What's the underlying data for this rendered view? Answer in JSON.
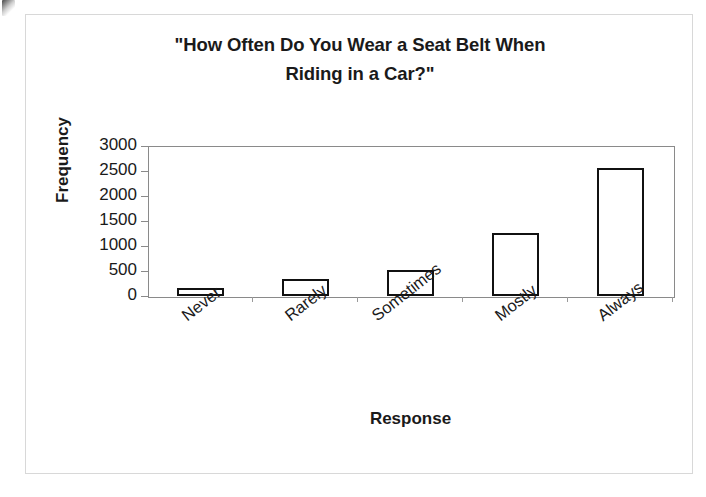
{
  "chart_data": {
    "type": "bar",
    "title": "\"How Often Do You Wear a Seat Belt When Riding in a Car?\"",
    "title_line1": "\"How Often Do You Wear a Seat Belt When",
    "title_line2": "Riding in a Car?\"",
    "xlabel": "Response",
    "ylabel": "Frequency",
    "categories": [
      "Never",
      "Rarely",
      "Sometimes",
      "Mostly",
      "Always"
    ],
    "values": [
      160,
      340,
      520,
      1270,
      2560
    ],
    "ylim": [
      0,
      3000
    ],
    "ytick_values": [
      3000,
      2500,
      2000,
      1500,
      1000,
      500,
      0
    ],
    "ytick_labels": [
      "3000",
      "2500",
      "2000",
      "1500",
      "1000",
      "500",
      "0"
    ],
    "grid": false,
    "legend": false,
    "bar_fill_color": "#ffffff",
    "bar_edge_color": "#111111",
    "axis_color": "#8a8a8a",
    "text_color": "#1a1a1a",
    "xtick_label_rotation": -38
  }
}
